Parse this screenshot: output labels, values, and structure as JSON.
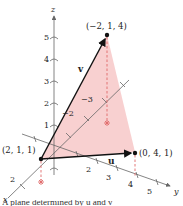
{
  "axes": {
    "x_label": "x",
    "y_label": "y",
    "z_label": "z",
    "z_ticks": [
      "1",
      "2",
      "3",
      "4",
      "5"
    ],
    "y_ticks": [
      "2",
      "3",
      "4",
      "5"
    ],
    "x_ticks": [
      "2"
    ],
    "neg_x_ticks": [
      "−2",
      "−3"
    ]
  },
  "points": {
    "p1": "(2, 1, 1)",
    "p2": "(−2, 1, 4)",
    "p3": "(0, 4, 1)"
  },
  "vectors": {
    "u": "u",
    "v": "v"
  },
  "colors": {
    "shade": "#f7c8c8",
    "dash": "#e06a6a",
    "axis": "#666666",
    "vector": "#111111"
  },
  "caption": "A plane determined by u and v"
}
